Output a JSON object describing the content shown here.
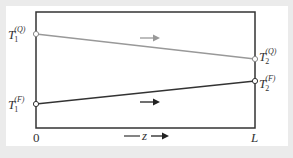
{
  "diagram": {
    "type": "temperature-profile",
    "colors": {
      "background": "#ebebeb",
      "panel": "#ffffff",
      "frame": "#333333",
      "line_Q": "#999999",
      "line_F": "#333333",
      "arrow_Q": "#999999",
      "arrow_F": "#222222"
    },
    "labels": {
      "T1Q": {
        "base": "T",
        "sub": "1",
        "sup": "(Q)"
      },
      "T2Q": {
        "base": "T",
        "sub": "2",
        "sup": "(Q)"
      },
      "T1F": {
        "base": "T",
        "sub": "1",
        "sup": "(F)"
      },
      "T2F": {
        "base": "T",
        "sub": "2",
        "sup": "(F)"
      }
    },
    "axis": {
      "start": "0",
      "end": "L",
      "variable": "z"
    },
    "lines": [
      {
        "name": "Q",
        "from": "T1Q",
        "to": "T2Q",
        "trend": "decreasing",
        "flow_direction": "right"
      },
      {
        "name": "F",
        "from": "T1F",
        "to": "T2F",
        "trend": "increasing",
        "flow_direction": "right"
      }
    ]
  }
}
